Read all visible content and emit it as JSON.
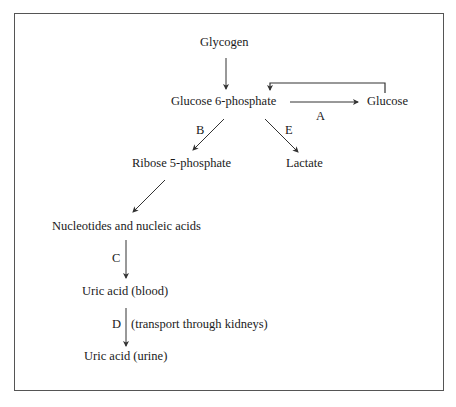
{
  "diagram": {
    "nodes": {
      "glycogen": "Glycogen",
      "glucose6p": "Glucose 6-phosphate",
      "glucose": "Glucose",
      "ribose5p": "Ribose 5-phosphate",
      "lactate": "Lactate",
      "nucleotides": "Nucleotides and nucleic acids",
      "uric_blood": "Uric acid (blood)",
      "uric_urine": "Uric acid (urine)"
    },
    "steps": {
      "A": "A",
      "B": "B",
      "C": "C",
      "D": "D",
      "E": "E"
    },
    "annotations": {
      "d_note": "(transport through kidneys)"
    },
    "edges": [
      {
        "from": "Glycogen",
        "to": "Glucose 6-phosphate",
        "label": ""
      },
      {
        "from": "Glucose 6-phosphate",
        "to": "Glucose",
        "label": "A"
      },
      {
        "from": "Glucose",
        "to": "Glucose 6-phosphate",
        "label": ""
      },
      {
        "from": "Glucose 6-phosphate",
        "to": "Ribose 5-phosphate",
        "label": "B"
      },
      {
        "from": "Glucose 6-phosphate",
        "to": "Lactate",
        "label": "E"
      },
      {
        "from": "Ribose 5-phosphate",
        "to": "Nucleotides and nucleic acids",
        "label": ""
      },
      {
        "from": "Nucleotides and nucleic acids",
        "to": "Uric acid (blood)",
        "label": "C"
      },
      {
        "from": "Uric acid (blood)",
        "to": "Uric acid (urine)",
        "label": "D"
      }
    ],
    "colors": {
      "line": "#333333",
      "frame": "#555555",
      "text": "#1a1a1a"
    }
  }
}
